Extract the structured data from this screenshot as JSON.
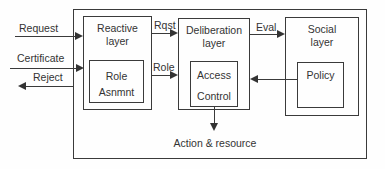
{
  "colors": {
    "line": "#3a3a3a",
    "text": "#333333",
    "background": "#fefefe"
  },
  "external_labels": {
    "request": "Request",
    "certificate": "Certificate",
    "reject": "Reject"
  },
  "flow_labels": {
    "rqst": "Rqst",
    "role": "Role",
    "eval": "Eval"
  },
  "output_label": "Action & resource",
  "layers": {
    "reactive": {
      "title_line1": "Reactive",
      "title_line2": "layer",
      "inner_line1": "Role",
      "inner_line2": "Asnmnt"
    },
    "deliberation": {
      "title_line1": "Deliberation",
      "title_line2": "layer",
      "inner_line1": "Access",
      "inner_line2": "Control"
    },
    "social": {
      "title_line1": "Social",
      "title_line2": "layer",
      "inner_line1": "Policy"
    }
  }
}
